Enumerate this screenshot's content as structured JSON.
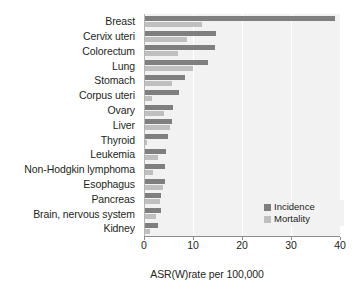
{
  "chart_data": {
    "type": "bar",
    "orientation": "horizontal",
    "title": "",
    "xlabel": "ASR(W)rate per 100,000",
    "ylabel": "",
    "xlim": [
      0,
      40
    ],
    "xticks": [
      0,
      10,
      20,
      30,
      40
    ],
    "grid": true,
    "legend_position": "bottom-right",
    "categories": [
      "Breast",
      "Cervix uteri",
      "Colorectum",
      "Lung",
      "Stomach",
      "Corpus uteri",
      "Ovary",
      "Liver",
      "Thyroid",
      "Leukemia",
      "Non-Hodgkin lymphoma",
      "Esophagus",
      "Pancreas",
      "Brain, nervous system",
      "Kidney"
    ],
    "series": [
      {
        "name": "Incidence",
        "color": "#7f7f7f",
        "values": [
          38.9,
          14.7,
          14.5,
          13.1,
          8.4,
          7.2,
          5.9,
          5.8,
          4.9,
          4.4,
          4.3,
          4.2,
          3.5,
          3.4,
          2.9
        ]
      },
      {
        "name": "Mortality",
        "color": "#bfbfbf",
        "values": [
          11.8,
          8.8,
          6.9,
          10.1,
          5.7,
          1.7,
          4.0,
          5.4,
          0.6,
          2.9,
          1.9,
          3.8,
          3.3,
          2.5,
          1.2
        ]
      }
    ]
  },
  "legend": {
    "items": [
      {
        "label": "Incidence"
      },
      {
        "label": "Mortality"
      }
    ]
  },
  "axis": {
    "x_title": "ASR(W)rate per 100,000",
    "tick_labels": [
      "0",
      "10",
      "20",
      "30",
      "40"
    ]
  }
}
